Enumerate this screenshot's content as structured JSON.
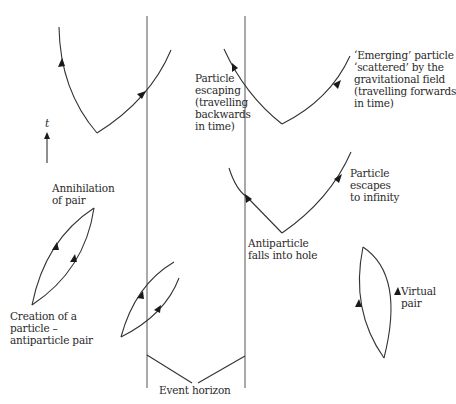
{
  "diagram": {
    "type": "spacetime diagram of particle-antiparticle pairs near a black hole event horizon",
    "colors": {
      "line": "#333333",
      "text": "#2a2a2a",
      "background": "#ffffff"
    },
    "time_axis": {
      "label": "t",
      "direction": "up"
    },
    "labels": {
      "emerging": "‘Emerging’ particle\n‘scattered’ by the\ngravitational field\n(travelling forwards\nin time)",
      "escaping_backwards": "Particle\nescaping\n(travelling\nbackwards\nin time)",
      "escapes_infinity": "Particle\nescapes\nto infinity",
      "antiparticle_falls": "Antiparticle\nfalls into hole",
      "annihilation": "Annihilation\nof pair",
      "creation": "Creation of a\nparticle –\nantiparticle pair",
      "virtual_pair": "Virtual\npair",
      "event_horizon": "Event horizon"
    },
    "event_horizon_lines_x": [
      147,
      245
    ]
  }
}
